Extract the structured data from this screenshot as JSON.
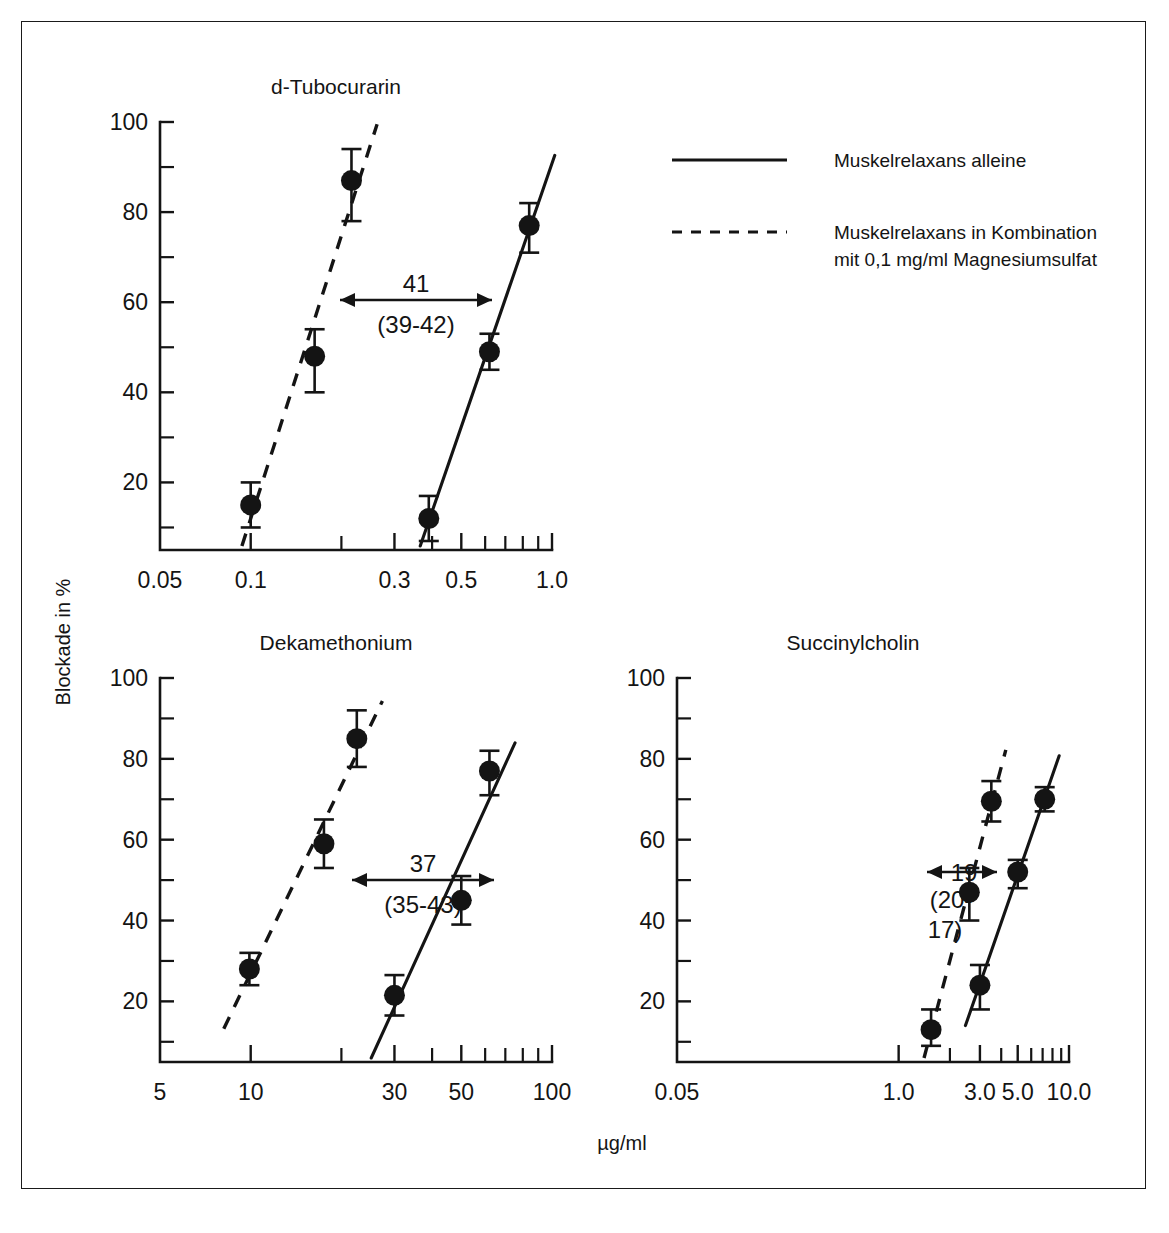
{
  "figure": {
    "y_axis_label": "Blockade in %",
    "x_axis_label": "µg/ml"
  },
  "legend": {
    "position": "top-right",
    "items": [
      {
        "style": "solid",
        "label": "Muskelrelaxans alleine",
        "label2": ""
      },
      {
        "style": "dashed",
        "label": "Muskelrelaxans in Kombination",
        "label2": "mit 0,1 mg/ml Magnesiumsulfat"
      }
    ]
  },
  "chart_data": [
    {
      "type": "scatter",
      "title": "d-Tubocurarin",
      "xlabel": "µg/ml",
      "ylabel": "Blockade in %",
      "xscale": "log",
      "xlim": [
        0.05,
        1.0
      ],
      "ylim": [
        5,
        100
      ],
      "grid": false,
      "xticks": [
        0.05,
        0.1,
        0.3,
        0.5,
        1.0
      ],
      "xticklabels": [
        "0.05",
        "0.1",
        "0.3",
        "0.5",
        "1.0"
      ],
      "xminorticks": [
        0.2,
        0.4,
        0.6,
        0.7,
        0.8,
        0.9
      ],
      "yticks": [
        20,
        40,
        60,
        80,
        100
      ],
      "yticklabels": [
        "20",
        "40",
        "60",
        "80",
        "100"
      ],
      "yminorticks": [
        10,
        30,
        50,
        70,
        90
      ],
      "annotation": {
        "value": "41",
        "range": "(39-42)"
      },
      "series": [
        {
          "name": "Muskelrelaxans alleine",
          "style": "solid",
          "x": [
            0.39,
            0.62,
            0.84
          ],
          "y": [
            12,
            49,
            77
          ],
          "yerr_low": [
            5,
            4,
            6
          ],
          "yerr_high": [
            5,
            4,
            5
          ]
        },
        {
          "name": "Muskelrelaxans in Kombination mit 0,1 mg/ml Magnesiumsulfat",
          "style": "dashed",
          "x": [
            0.1,
            0.163,
            0.216
          ],
          "y": [
            15,
            48,
            87
          ],
          "yerr_low": [
            5,
            8,
            9
          ],
          "yerr_high": [
            5,
            6,
            7
          ]
        }
      ]
    },
    {
      "type": "scatter",
      "title": "Dekamethonium",
      "xlabel": "µg/ml",
      "ylabel": "Blockade in %",
      "xscale": "log",
      "xlim": [
        5,
        100
      ],
      "ylim": [
        5,
        100
      ],
      "grid": false,
      "xticks": [
        5,
        10,
        30,
        50,
        100
      ],
      "xticklabels": [
        "5",
        "10",
        "30",
        "50",
        "100"
      ],
      "xminorticks": [
        20,
        40,
        60,
        70,
        80,
        90
      ],
      "yticks": [
        20,
        40,
        60,
        80,
        100
      ],
      "yticklabels": [
        "20",
        "40",
        "60",
        "80",
        "100"
      ],
      "yminorticks": [
        10,
        30,
        50,
        70,
        90
      ],
      "annotation": {
        "value": "37",
        "range": "(35-43)"
      },
      "series": [
        {
          "name": "Muskelrelaxans alleine",
          "style": "solid",
          "x": [
            30,
            50,
            62
          ],
          "y": [
            21.5,
            45,
            77
          ],
          "yerr_low": [
            5,
            6,
            6
          ],
          "yerr_high": [
            5,
            6,
            5
          ]
        },
        {
          "name": "Muskelrelaxans in Kombination mit 0,1 mg/ml Magnesiumsulfat",
          "style": "dashed",
          "x": [
            9.9,
            17.5,
            22.5
          ],
          "y": [
            28,
            59,
            85
          ],
          "yerr_low": [
            4,
            6,
            7
          ],
          "yerr_high": [
            4,
            6,
            7
          ]
        }
      ]
    },
    {
      "type": "scatter",
      "title": "Succinylcholin",
      "xlabel": "µg/ml",
      "ylabel": "Blockade in %",
      "xscale": "log",
      "xlim": [
        0.05,
        10.0
      ],
      "ylim": [
        5,
        100
      ],
      "grid": false,
      "xticks": [
        0.05,
        1.0,
        3.0,
        5.0,
        10.0
      ],
      "xticklabels": [
        "0.05",
        "1.0",
        "3.0",
        "5.0",
        "10.0"
      ],
      "xminorticks": [
        2.0,
        4.0,
        6.0,
        7.0,
        8.0,
        9.0
      ],
      "yticks": [
        20,
        40,
        60,
        80,
        100
      ],
      "yticklabels": [
        "20",
        "40",
        "60",
        "80",
        "100"
      ],
      "yminorticks": [
        10,
        30,
        50,
        70,
        90
      ],
      "annotation": {
        "value": "19",
        "range_line1": "(20-",
        "range_line2": "17)"
      },
      "series": [
        {
          "name": "Muskelrelaxans alleine",
          "style": "solid",
          "x": [
            3.0,
            5.0,
            7.2
          ],
          "y": [
            24,
            52,
            70
          ],
          "yerr_low": [
            6,
            4,
            3
          ],
          "yerr_high": [
            5,
            3,
            3
          ]
        },
        {
          "name": "Muskelrelaxans in Kombination mit 0,1 mg/ml Magnesiumsulfat",
          "style": "dashed",
          "x": [
            1.55,
            2.6,
            3.5
          ],
          "y": [
            13,
            47,
            69.5
          ],
          "yerr_low": [
            4,
            7,
            5
          ],
          "yerr_high": [
            5,
            6,
            5
          ]
        }
      ]
    }
  ]
}
